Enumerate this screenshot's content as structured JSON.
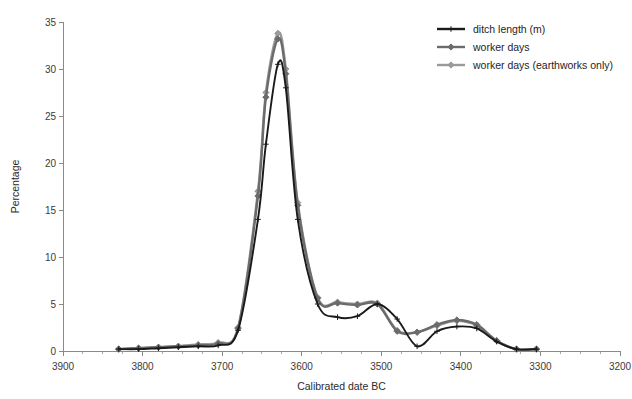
{
  "chart_data": {
    "type": "line",
    "title": "",
    "xlabel": "Calibrated date BC",
    "ylabel": "Percentage",
    "xlim": [
      3900,
      3200
    ],
    "ylim": [
      0,
      35
    ],
    "x_reversed": true,
    "grid": false,
    "legend_position": "top-right",
    "x_ticks": [
      3900,
      3800,
      3700,
      3600,
      3500,
      3400,
      3300,
      3200
    ],
    "x_tick_labels": [
      "3900",
      "3800",
      "3700",
      "3600",
      "3500",
      "3400",
      "3300",
      "3200"
    ],
    "x_minor_step": 25,
    "y_ticks": [
      0,
      5,
      10,
      15,
      20,
      25,
      30,
      35
    ],
    "y_tick_labels": [
      "0",
      "5",
      "10",
      "15",
      "20",
      "25",
      "30",
      "35"
    ],
    "x": [
      3830,
      3805,
      3780,
      3755,
      3730,
      3705,
      3680,
      3655,
      3645,
      3630,
      3620,
      3605,
      3580,
      3555,
      3530,
      3505,
      3480,
      3455,
      3430,
      3405,
      3380,
      3355,
      3330,
      3305
    ],
    "series": [
      {
        "name": "ditch length (m)",
        "color": "#1a1a1a",
        "marker": "plus",
        "values": [
          0.2,
          0.2,
          0.3,
          0.4,
          0.5,
          0.6,
          2.2,
          14.0,
          22.0,
          30.5,
          28.0,
          14.0,
          5.0,
          3.6,
          3.7,
          5.0,
          3.4,
          0.5,
          2.1,
          2.6,
          2.4,
          1.0,
          0.2,
          0.2
        ]
      },
      {
        "name": "worker days",
        "color": "#6b6b6b",
        "marker": "diamond",
        "values": [
          0.2,
          0.3,
          0.4,
          0.5,
          0.6,
          0.8,
          2.4,
          16.5,
          27.0,
          33.2,
          29.5,
          15.5,
          5.6,
          5.1,
          4.9,
          5.0,
          2.1,
          2.0,
          2.8,
          3.3,
          2.8,
          1.1,
          0.2,
          0.2
        ]
      },
      {
        "name": "worker days (earthworks only)",
        "color": "#9a9a9a",
        "marker": "diamond",
        "values": [
          0.2,
          0.3,
          0.4,
          0.5,
          0.7,
          0.9,
          2.5,
          17.0,
          27.5,
          33.8,
          30.0,
          15.8,
          5.7,
          5.2,
          5.0,
          5.1,
          2.2,
          2.0,
          2.7,
          3.2,
          2.7,
          1.1,
          0.2,
          0.2
        ]
      }
    ]
  },
  "legend": {
    "items": [
      {
        "label": "ditch length (m)",
        "color": "#1a1a1a"
      },
      {
        "label": "worker days",
        "color": "#6b6b6b"
      },
      {
        "label": "worker days (earthworks only)",
        "color": "#9a9a9a"
      }
    ]
  },
  "colors": {
    "background": "#ffffff",
    "axis": "#8a8a8a",
    "text": "#2b2b2b",
    "series_1": "#1a1a1a",
    "series_2": "#6b6b6b",
    "series_3": "#9a9a9a"
  }
}
